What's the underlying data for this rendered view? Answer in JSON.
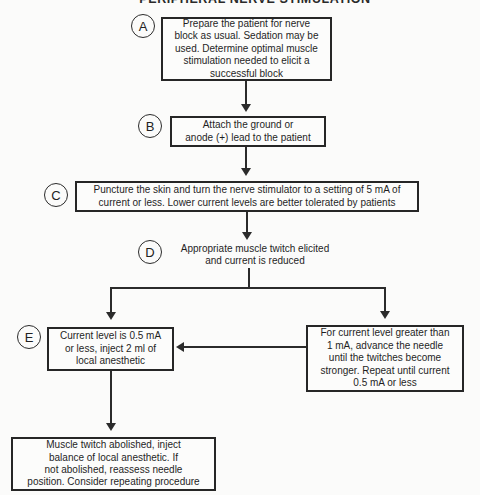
{
  "title": "PERIPHERAL NERVE STIMULATION",
  "nodes": {
    "a": {
      "label": "A",
      "text": "Prepare the patient for nerve\nblock as usual. Sedation may be\nused. Determine optimal muscle\nstimulation needed to elicit a\nsuccessful block"
    },
    "b": {
      "label": "B",
      "text": "Attach the ground or\nanode (+) lead to the patient"
    },
    "c": {
      "label": "C",
      "text": "Puncture the skin and turn the nerve stimulator to a setting of 5 mA of\ncurrent or less.  Lower current levels are better tolerated by patients"
    },
    "d": {
      "label": "D",
      "text": "Appropriate muscle twitch elicited\nand current is reduced"
    },
    "e": {
      "label": "E",
      "text": "Current level is 0.5 mA\nor less, inject 2 ml of\nlocal anesthetic"
    },
    "right": {
      "text": "For current level greater than\n1 mA, advance the needle\nuntil the twitches become\nstronger. Repeat until current\n0.5 mA or less"
    },
    "bottom": {
      "text": "Muscle twitch abolished, inject\nbalance of local anesthetic. If\nnot abolished, reassess needle\nposition. Consider repeating procedure"
    }
  },
  "colors": {
    "ink": "#2b2b2b",
    "paper": "#fbfbfa"
  }
}
